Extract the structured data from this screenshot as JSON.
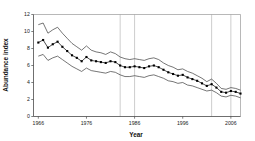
{
  "chart_data": {
    "type": "line",
    "title": "",
    "xlabel": "Year",
    "ylabel": "Abundance index",
    "xlim": [
      1965,
      2008
    ],
    "ylim": [
      0,
      12
    ],
    "grid": "vertical-only",
    "legend": "none",
    "xticks": [
      1966,
      1976,
      1986,
      1996,
      2006
    ],
    "xtick_labels": [
      "1966",
      "1976",
      "1986",
      "1996",
      "2006"
    ],
    "yticks": [
      0,
      2,
      4,
      6,
      8,
      10,
      12
    ],
    "ytick_labels": [
      "0",
      "2",
      "4",
      "6",
      "8",
      "10",
      "12"
    ],
    "gridline_years": [
      1983,
      1986,
      2002,
      2006
    ],
    "x": [
      1966,
      1967,
      1968,
      1969,
      1970,
      1971,
      1972,
      1973,
      1974,
      1975,
      1976,
      1977,
      1978,
      1979,
      1980,
      1981,
      1982,
      1983,
      1984,
      1985,
      1986,
      1987,
      1988,
      1989,
      1990,
      1991,
      1992,
      1993,
      1994,
      1995,
      1996,
      1997,
      1998,
      1999,
      2000,
      2001,
      2002,
      2003,
      2004,
      2005,
      2006,
      2007,
      2008
    ],
    "series": [
      {
        "name": "Abundance index",
        "style": "line-with-markers",
        "values": [
          8.7,
          9.0,
          8.1,
          8.5,
          8.8,
          8.2,
          7.7,
          7.2,
          6.9,
          6.5,
          7.0,
          6.6,
          6.5,
          6.4,
          6.3,
          6.5,
          6.4,
          6.0,
          5.8,
          5.8,
          5.9,
          5.8,
          5.7,
          5.9,
          6.0,
          5.8,
          5.5,
          5.2,
          5.0,
          4.8,
          4.9,
          4.6,
          4.4,
          4.2,
          3.9,
          3.6,
          3.8,
          3.4,
          2.9,
          2.8,
          3.0,
          2.9,
          2.7
        ]
      },
      {
        "name": "Upper confidence limit",
        "style": "line",
        "values": [
          10.8,
          11.0,
          9.8,
          10.2,
          10.5,
          9.8,
          9.2,
          8.6,
          8.2,
          7.8,
          8.3,
          7.8,
          7.6,
          7.5,
          7.3,
          7.6,
          7.4,
          7.0,
          6.8,
          6.7,
          6.8,
          6.7,
          6.6,
          6.8,
          6.9,
          6.7,
          6.3,
          6.0,
          5.8,
          5.5,
          5.6,
          5.3,
          5.1,
          4.8,
          4.5,
          4.1,
          4.4,
          3.9,
          3.3,
          3.2,
          3.4,
          3.3,
          3.1
        ]
      },
      {
        "name": "Lower confidence limit",
        "style": "line",
        "values": [
          7.1,
          7.3,
          6.6,
          6.9,
          7.1,
          6.7,
          6.3,
          5.9,
          5.6,
          5.3,
          5.7,
          5.4,
          5.3,
          5.2,
          5.1,
          5.3,
          5.2,
          4.9,
          4.7,
          4.7,
          4.8,
          4.7,
          4.6,
          4.8,
          4.9,
          4.7,
          4.5,
          4.2,
          4.1,
          3.9,
          4.0,
          3.7,
          3.6,
          3.4,
          3.2,
          3.0,
          3.1,
          2.8,
          2.4,
          2.3,
          2.5,
          2.4,
          2.2
        ]
      }
    ]
  }
}
